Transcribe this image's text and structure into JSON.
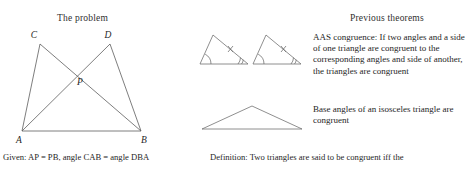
{
  "left_panel": {
    "heading": "The problem",
    "diagram": {
      "name": "two-overlapping-triangles-figure",
      "vertex_labels": [
        "C",
        "D",
        "P",
        "A",
        "B"
      ],
      "segments": [
        "A-C",
        "A-D",
        "B-C",
        "B-D",
        "A-B"
      ],
      "intersection_label": "P"
    },
    "given_caption": "Given: AP = PB, angle CAB = angle DBA"
  },
  "right_panel": {
    "heading": "Previous theorems",
    "theorems": [
      {
        "figure": "pair-of-congruent-triangles",
        "text": "AAS congruence: If two angles and a side of one triangle are congruent to the corresponding angles and side of another, the triangles are congruent"
      },
      {
        "figure": "isosceles-triangle",
        "text": "Base angles of an isosceles triangle are congruent"
      }
    ],
    "definition_caption": "Definition: Two triangles are said to be congruent iff the"
  },
  "colors": {
    "ink": "#262626",
    "line": "#5d5d5d",
    "background": "#ffffff"
  }
}
